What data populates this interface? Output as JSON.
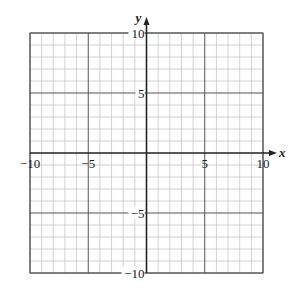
{
  "chart_data": {
    "type": "scatter",
    "title": "",
    "xlabel": "x",
    "ylabel": "y",
    "xlim": [
      -10,
      10
    ],
    "ylim": [
      -10,
      10
    ],
    "grid": true,
    "grid_step": 1,
    "major_grid_step": 5,
    "x_tick_labels": [
      "−10",
      "−5",
      "5",
      "10"
    ],
    "x_tick_values": [
      -10,
      -5,
      5,
      10
    ],
    "y_tick_labels": [
      "10",
      "5",
      "−5",
      "−10"
    ],
    "y_tick_values": [
      10,
      5,
      -5,
      -10
    ],
    "series": [],
    "legend": null
  },
  "colors": {
    "minor_grid": "#c8c8c8",
    "major_grid": "#555555",
    "axis": "#222222",
    "background": "#ffffff"
  }
}
